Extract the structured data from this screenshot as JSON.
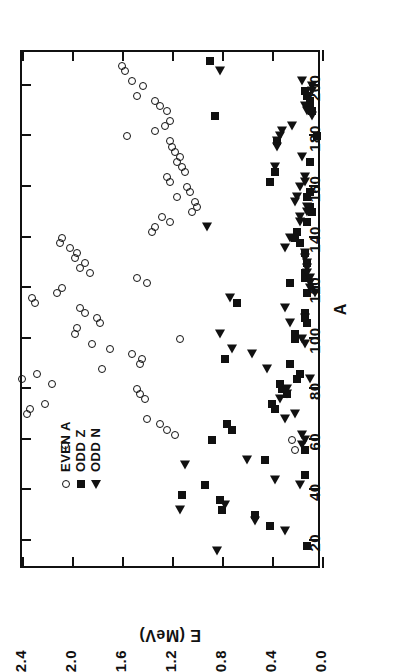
{
  "chart_data": {
    "type": "scatter",
    "title": "",
    "xlabel": "A",
    "ylabel": "E (MeV)",
    "xlim": [
      10,
      215
    ],
    "ylim": [
      0.0,
      2.4
    ],
    "xticks": [
      20,
      40,
      60,
      80,
      100,
      120,
      140,
      160,
      180,
      200
    ],
    "xtick_labels": [
      "20",
      "40",
      "60",
      "80",
      "100",
      "120",
      "140",
      "160",
      "180",
      "200"
    ],
    "yticks": [
      0.0,
      0.4,
      0.8,
      1.2,
      1.6,
      2.0,
      2.4
    ],
    "ytick_labels": [
      "0.0",
      "0.4",
      "0.8",
      "1.2",
      "1.6",
      "2.0",
      "2.4"
    ],
    "grid": false,
    "rotation_deg": -90,
    "legend_position": "upper-left-inside",
    "series": [
      {
        "name": "EVEN A",
        "marker": "open-circle",
        "color": "#111111",
        "points": [
          [
            206,
            1.58
          ],
          [
            208,
            1.6
          ],
          [
            202,
            1.52
          ],
          [
            200,
            1.43
          ],
          [
            196,
            1.48
          ],
          [
            194,
            1.34
          ],
          [
            192,
            1.3
          ],
          [
            190,
            1.24
          ],
          [
            186,
            1.22
          ],
          [
            184,
            1.26
          ],
          [
            180,
            1.56
          ],
          [
            182,
            1.34
          ],
          [
            178,
            1.22
          ],
          [
            176,
            1.2
          ],
          [
            174,
            1.18
          ],
          [
            172,
            1.14
          ],
          [
            170,
            1.16
          ],
          [
            168,
            1.12
          ],
          [
            166,
            1.1
          ],
          [
            164,
            1.24
          ],
          [
            162,
            1.22
          ],
          [
            160,
            1.08
          ],
          [
            158,
            1.06
          ],
          [
            156,
            1.16
          ],
          [
            154,
            1.02
          ],
          [
            152,
            1.0
          ],
          [
            150,
            1.04
          ],
          [
            148,
            1.28
          ],
          [
            146,
            1.22
          ],
          [
            144,
            1.34
          ],
          [
            142,
            1.36
          ],
          [
            140,
            2.08
          ],
          [
            138,
            2.1
          ],
          [
            136,
            2.02
          ],
          [
            134,
            1.96
          ],
          [
            132,
            1.98
          ],
          [
            130,
            1.9
          ],
          [
            128,
            1.94
          ],
          [
            126,
            1.86
          ],
          [
            124,
            1.48
          ],
          [
            122,
            1.4
          ],
          [
            120,
            2.08
          ],
          [
            118,
            2.12
          ],
          [
            116,
            2.32
          ],
          [
            114,
            2.3
          ],
          [
            112,
            1.94
          ],
          [
            110,
            1.9
          ],
          [
            108,
            1.8
          ],
          [
            106,
            1.78
          ],
          [
            104,
            1.96
          ],
          [
            102,
            1.98
          ],
          [
            100,
            1.14
          ],
          [
            98,
            1.84
          ],
          [
            96,
            1.7
          ],
          [
            94,
            1.52
          ],
          [
            92,
            1.44
          ],
          [
            90,
            1.46
          ],
          [
            88,
            1.76
          ],
          [
            86,
            2.28
          ],
          [
            84,
            2.4
          ],
          [
            82,
            2.16
          ],
          [
            80,
            1.48
          ],
          [
            78,
            1.46
          ],
          [
            76,
            1.42
          ],
          [
            74,
            2.22
          ],
          [
            72,
            2.34
          ],
          [
            70,
            2.36
          ],
          [
            68,
            1.4
          ],
          [
            66,
            1.3
          ],
          [
            64,
            1.24
          ],
          [
            62,
            1.18
          ],
          [
            60,
            0.24
          ],
          [
            58,
            2.06
          ],
          [
            56,
            0.22
          ]
        ]
      },
      {
        "name": "ODD Z",
        "marker": "filled-square",
        "color": "#111111",
        "points": [
          [
            210,
            0.9
          ],
          [
            198,
            0.14
          ],
          [
            196,
            0.12
          ],
          [
            194,
            0.1
          ],
          [
            192,
            0.1
          ],
          [
            190,
            0.08
          ],
          [
            188,
            0.86
          ],
          [
            180,
            0.04
          ],
          [
            178,
            0.36
          ],
          [
            170,
            0.1
          ],
          [
            166,
            0.38
          ],
          [
            162,
            0.42
          ],
          [
            158,
            0.1
          ],
          [
            156,
            0.12
          ],
          [
            152,
            0.1
          ],
          [
            150,
            0.08
          ],
          [
            146,
            0.12
          ],
          [
            142,
            0.2
          ],
          [
            140,
            0.22
          ],
          [
            138,
            0.18
          ],
          [
            134,
            0.14
          ],
          [
            130,
            0.12
          ],
          [
            126,
            0.14
          ],
          [
            124,
            0.14
          ],
          [
            122,
            0.26
          ],
          [
            118,
            0.12
          ],
          [
            114,
            0.68
          ],
          [
            110,
            0.14
          ],
          [
            108,
            0.14
          ],
          [
            106,
            0.12
          ],
          [
            102,
            0.22
          ],
          [
            100,
            0.22
          ],
          [
            92,
            0.78
          ],
          [
            90,
            0.26
          ],
          [
            86,
            0.18
          ],
          [
            84,
            0.2
          ],
          [
            82,
            0.34
          ],
          [
            80,
            0.32
          ],
          [
            78,
            0.28
          ],
          [
            74,
            0.4
          ],
          [
            72,
            0.38
          ],
          [
            66,
            0.76
          ],
          [
            64,
            0.72
          ],
          [
            60,
            0.88
          ],
          [
            56,
            0.14
          ],
          [
            52,
            0.46
          ],
          [
            46,
            0.14
          ],
          [
            42,
            0.94
          ],
          [
            38,
            1.12
          ],
          [
            36,
            0.82
          ],
          [
            32,
            0.8
          ],
          [
            30,
            0.54
          ],
          [
            26,
            0.42
          ],
          [
            18,
            0.12
          ]
        ]
      },
      {
        "name": "ODD N",
        "marker": "filled-triangle",
        "color": "#111111",
        "points": [
          [
            206,
            0.82
          ],
          [
            202,
            0.16
          ],
          [
            200,
            0.08
          ],
          [
            198,
            0.08
          ],
          [
            192,
            0.14
          ],
          [
            190,
            0.12
          ],
          [
            188,
            0.08
          ],
          [
            184,
            0.24
          ],
          [
            182,
            0.32
          ],
          [
            180,
            0.34
          ],
          [
            178,
            0.36
          ],
          [
            176,
            0.36
          ],
          [
            172,
            0.16
          ],
          [
            168,
            0.38
          ],
          [
            164,
            0.14
          ],
          [
            162,
            0.14
          ],
          [
            160,
            0.18
          ],
          [
            156,
            0.2
          ],
          [
            154,
            0.22
          ],
          [
            152,
            0.12
          ],
          [
            150,
            0.12
          ],
          [
            148,
            0.18
          ],
          [
            146,
            0.18
          ],
          [
            144,
            0.92
          ],
          [
            140,
            0.26
          ],
          [
            136,
            0.3
          ],
          [
            134,
            0.14
          ],
          [
            132,
            0.14
          ],
          [
            130,
            0.12
          ],
          [
            128,
            0.12
          ],
          [
            126,
            0.12
          ],
          [
            124,
            0.1
          ],
          [
            122,
            0.1
          ],
          [
            120,
            0.1
          ],
          [
            118,
            0.06
          ],
          [
            116,
            0.74
          ],
          [
            112,
            0.3
          ],
          [
            108,
            0.14
          ],
          [
            106,
            0.26
          ],
          [
            102,
            0.82
          ],
          [
            100,
            0.16
          ],
          [
            98,
            0.14
          ],
          [
            96,
            0.72
          ],
          [
            94,
            0.56
          ],
          [
            88,
            0.44
          ],
          [
            84,
            0.1
          ],
          [
            80,
            0.28
          ],
          [
            78,
            0.28
          ],
          [
            76,
            0.34
          ],
          [
            70,
            0.22
          ],
          [
            68,
            0.3
          ],
          [
            62,
            0.16
          ],
          [
            60,
            0.14
          ],
          [
            58,
            0.16
          ],
          [
            52,
            0.6
          ],
          [
            50,
            1.1
          ],
          [
            44,
            0.38
          ],
          [
            42,
            0.18
          ],
          [
            34,
            0.78
          ],
          [
            32,
            1.14
          ],
          [
            28,
            0.54
          ],
          [
            24,
            0.3
          ],
          [
            16,
            0.84
          ]
        ]
      }
    ]
  },
  "legend": {
    "entries": [
      {
        "label": "EVEN A",
        "marker": "open-circle"
      },
      {
        "label": "ODD Z",
        "marker": "filled-square"
      },
      {
        "label": "ODD N",
        "marker": "filled-triangle"
      }
    ]
  }
}
